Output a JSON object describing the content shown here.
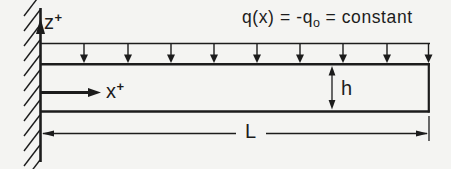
{
  "diagram": {
    "load_equation": {
      "pre": "q(x) = -q",
      "sub": "o",
      "post": " = constant"
    },
    "z_axis": {
      "letter": "z",
      "superscript": "+"
    },
    "x_axis": {
      "letter": "x",
      "superscript": "+"
    },
    "beam_height_label": "h",
    "beam_length_label": "L",
    "colors": {
      "ink": "#1c1c1c",
      "background": "#f4f4f2"
    }
  }
}
